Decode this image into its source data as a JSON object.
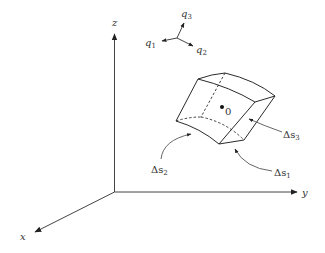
{
  "figure": {
    "axes": {
      "x_label": "x",
      "y_label": "y",
      "z_label": "z"
    },
    "curvilinear_frame": {
      "q1_label": "q",
      "q1_sub": "1",
      "q2_label": "q",
      "q2_sub": "2",
      "q3_label": "q",
      "q3_sub": "3"
    },
    "element": {
      "center_label": "0",
      "ds1_prefix": "Δs",
      "ds1_sub": "1",
      "ds2_prefix": "Δs",
      "ds2_sub": "2",
      "ds3_prefix": "Δs",
      "ds3_sub": "3"
    }
  }
}
